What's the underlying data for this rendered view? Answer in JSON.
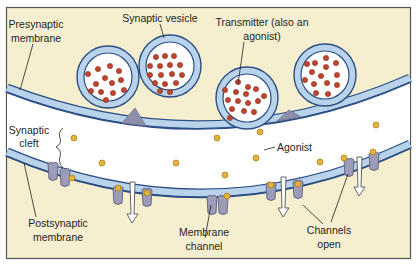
{
  "diagram": {
    "labels": {
      "presynaptic_line1": "Presynaptic",
      "presynaptic_line2": "membrane",
      "synaptic_vesicle": "Synaptic vesicle",
      "transmitter_line1": "Transmitter (also an",
      "transmitter_line2": "agonist)",
      "synaptic_cleft_line1": "Synaptic",
      "synaptic_cleft_line2": "cleft",
      "agonist": "Agonist",
      "postsynaptic_line1": "Postsynaptic",
      "postsynaptic_line2": "membrane",
      "membrane_channel_line1": "Membrane",
      "membrane_channel_line2": "channel",
      "channels_open_line1": "Channels",
      "channels_open_line2": "open"
    },
    "colors": {
      "background": "#f5efcf",
      "cleft": "#ffffff",
      "membrane_fill": "#b9d3ea",
      "membrane_edge": "#2c4f86",
      "vesicle_fill": "#b9d3ea",
      "transmitter_dot": "#c0452e",
      "agonist_dot": "#e3b23a",
      "channel": "#9c9cb8",
      "release_site": "#8f8fab",
      "frame": "#555555"
    },
    "vesicles": [
      {
        "cx": 108,
        "cy": 77,
        "r": 31
      },
      {
        "cx": 170,
        "cy": 66,
        "r": 31
      },
      {
        "cx": 247,
        "cy": 98,
        "r": 31
      },
      {
        "cx": 325,
        "cy": 75,
        "r": 31
      }
    ],
    "free_agonists": [
      {
        "x": 74,
        "y": 138
      },
      {
        "x": 102,
        "y": 163
      },
      {
        "x": 176,
        "y": 163
      },
      {
        "x": 225,
        "y": 175
      },
      {
        "x": 256,
        "y": 158
      },
      {
        "x": 320,
        "y": 162
      },
      {
        "x": 376,
        "y": 125
      },
      {
        "x": 165,
        "y": 196
      }
    ],
    "channels": [
      {
        "x": 52,
        "y": 170,
        "open": false,
        "bound": 1
      },
      {
        "x": 63,
        "y": 177,
        "open": false,
        "bound": 1
      },
      {
        "x": 118,
        "y": 196,
        "open": false,
        "bound": 1
      },
      {
        "x": 146,
        "y": 198,
        "open": false,
        "bound": 1
      },
      {
        "x": 210,
        "y": 205,
        "open": false,
        "bound": 1
      },
      {
        "x": 223,
        "y": 205,
        "open": false,
        "bound": 1
      },
      {
        "x": 271,
        "y": 192,
        "open": true,
        "bound": 1
      },
      {
        "x": 298,
        "y": 187,
        "open": true,
        "bound": 1
      },
      {
        "x": 349,
        "y": 168,
        "open": true,
        "bound": 1
      },
      {
        "x": 371,
        "y": 160,
        "open": true,
        "bound": 1
      }
    ],
    "arrows": [
      {
        "x": 133,
        "y1": 182,
        "y2": 222
      },
      {
        "x": 284,
        "y1": 178,
        "y2": 216
      },
      {
        "x": 360,
        "y1": 158,
        "y2": 196
      }
    ]
  }
}
